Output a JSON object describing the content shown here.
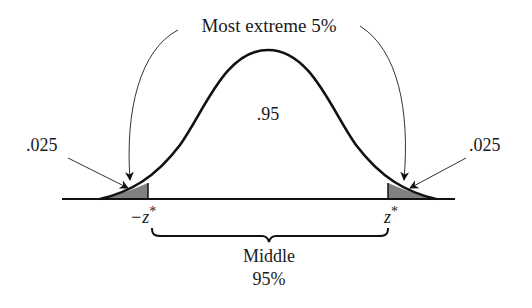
{
  "diagram": {
    "type": "normal-distribution-critical-region",
    "title_label": "Most extreme 5%",
    "center_area_label": ".95",
    "left_tail_label": ".025",
    "right_tail_label": ".025",
    "left_critical_label": "−z",
    "left_critical_sup": "*",
    "right_critical_label": "z",
    "right_critical_sup": "*",
    "middle_label_line1": "Middle",
    "middle_label_line2": "95%",
    "colors": {
      "curve": "#111111",
      "tail_fill": "#808080",
      "arrows": "#333333",
      "text": "#1a1a1a"
    }
  }
}
